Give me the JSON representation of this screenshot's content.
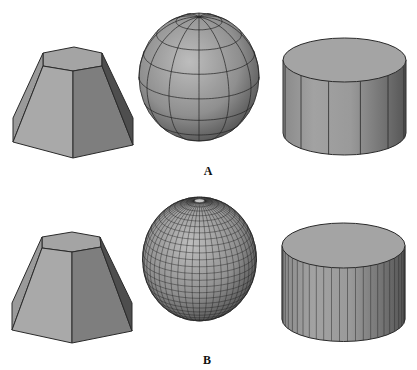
{
  "figure": {
    "colors": {
      "background": "#ffffff",
      "edge": "#2a2a2a",
      "face_light": "#a9a9a9",
      "face_mid": "#9a9a9a",
      "face_dark": "#7e7e7e",
      "face_darkest": "#4e4e4e",
      "top_face": "#a4a4a4"
    },
    "panels": [
      {
        "label": "A",
        "label_pos": [
          208,
          171
        ],
        "description": "Low tessellation",
        "frustum": {
          "top": [
            [
              43,
              53
            ],
            [
              74,
              47
            ],
            [
              102,
              53
            ]
          ],
          "top_front": [
            [
              43,
              66
            ],
            [
              73,
              71
            ],
            [
              102,
              66
            ]
          ],
          "bottom": [
            [
              13,
              118
            ],
            [
              13,
              142
            ],
            [
              73,
              158
            ],
            [
              133,
              145
            ],
            [
              133,
              118
            ]
          ]
        },
        "sphere": {
          "cx": 199,
          "cy": 77,
          "rx": 60,
          "ry": 64,
          "meridians": 12,
          "parallels": 8
        },
        "cylinder": {
          "cx": 344.5,
          "rx": 61.5,
          "top_cy": 60,
          "ry": 22,
          "bottom_cy": 133,
          "segments": 12
        }
      },
      {
        "label": "B",
        "label_pos": [
          207,
          360
        ],
        "description": "High tessellation",
        "frustum": {
          "top": [
            [
              42,
              237
            ],
            [
              72,
              232
            ],
            [
              100,
              237
            ]
          ],
          "top_front": [
            [
              42,
              248
            ],
            [
              72,
              252
            ],
            [
              101,
              247
            ]
          ],
          "bottom": [
            [
              12,
              303
            ],
            [
              12,
              330
            ],
            [
              72,
              343
            ],
            [
              132,
              331
            ],
            [
              132,
              303
            ]
          ]
        },
        "sphere": {
          "cx": 199.5,
          "cy": 259,
          "rx": 57,
          "ry": 62,
          "meridians": 48,
          "parallels": 28
        },
        "cylinder": {
          "cx": 343.5,
          "rx": 61.5,
          "top_cy": 245.5,
          "ry": 22.5,
          "bottom_cy": 319,
          "segments": 48
        }
      }
    ]
  }
}
